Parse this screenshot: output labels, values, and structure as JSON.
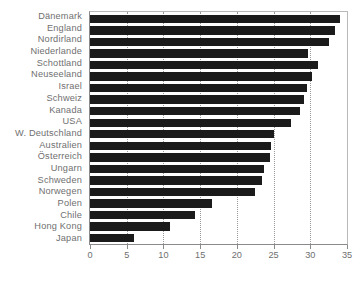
{
  "chart_data": {
    "type": "bar",
    "orientation": "horizontal",
    "title": "",
    "subtitle": "",
    "xlabel": "",
    "ylabel": "",
    "xlim": [
      0,
      35
    ],
    "ylim": null,
    "grid": "vertical-dotted",
    "legend": null,
    "bar_color": "#1b1b1b",
    "label_color": "#6f6f6f",
    "axis_color": "#8a8a8a",
    "background": "#ffffff",
    "xticks": [
      0,
      5,
      10,
      15,
      20,
      25,
      30,
      35
    ],
    "xticklabels": [
      "0",
      "5",
      "10",
      "15",
      "20",
      "25",
      "30",
      "35"
    ],
    "categories": [
      "Dänemark",
      "England",
      "Nordirland",
      "Niederlande",
      "Schottland",
      "Neuseeland",
      "Israel",
      "Schweiz",
      "Kanada",
      "USA",
      "W. Deutschland",
      "Australien",
      "Österreich",
      "Ungarn",
      "Schweden",
      "Norwegen",
      "Polen",
      "Chile",
      "Hong Kong",
      "Japan"
    ],
    "values": [
      34.0,
      33.3,
      32.6,
      29.7,
      31.1,
      30.3,
      29.6,
      29.2,
      28.6,
      27.4,
      25.1,
      24.7,
      24.5,
      23.7,
      23.4,
      22.5,
      16.6,
      14.3,
      10.9,
      6.0
    ]
  }
}
